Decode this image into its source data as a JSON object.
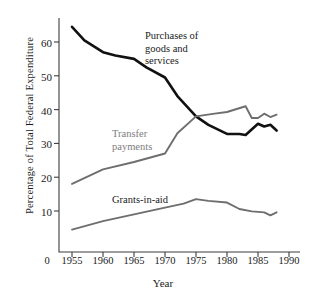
{
  "chart_data": {
    "type": "line",
    "title": "",
    "xlabel": "Year",
    "ylabel": "Percentage of Total Federal Expenditure",
    "xlim": [
      1953,
      1990
    ],
    "ylim": [
      0,
      67
    ],
    "xticks": [
      "0",
      "1955",
      "1960",
      "1965",
      "1970",
      "1975",
      "1980",
      "1985",
      "1990"
    ],
    "xtick_values": [
      1953.2,
      1955,
      1960,
      1965,
      1970,
      1975,
      1980,
      1985,
      1990
    ],
    "yticks": [
      "10",
      "20",
      "30",
      "40",
      "50",
      "60"
    ],
    "ytick_values": [
      10,
      20,
      30,
      40,
      50,
      60
    ],
    "grid": false,
    "legend_position": "inline-annotations",
    "series": [
      {
        "name": "Purchases of goods and services",
        "color": "#111111",
        "x": [
          1955,
          1957,
          1960,
          1962,
          1965,
          1967,
          1970,
          1972,
          1975,
          1977,
          1980,
          1982,
          1983,
          1985,
          1986,
          1987,
          1988
        ],
        "values": [
          64.5,
          60.5,
          57.0,
          56.0,
          55.0,
          52.5,
          49.5,
          44.0,
          38.0,
          35.5,
          32.8,
          32.8,
          32.5,
          35.8,
          35.0,
          35.5,
          33.8
        ]
      },
      {
        "name": "Transfer payments",
        "color": "#6e6e6e",
        "x": [
          1955,
          1960,
          1965,
          1970,
          1972,
          1975,
          1978,
          1980,
          1983,
          1984,
          1985,
          1986,
          1987,
          1988
        ],
        "values": [
          18.0,
          22.3,
          24.5,
          27.0,
          33.0,
          38.0,
          38.8,
          39.3,
          41.0,
          37.5,
          37.5,
          38.8,
          37.8,
          38.5
        ]
      },
      {
        "name": "Grants-in-aid",
        "color": "#6e6e6e",
        "x": [
          1955,
          1960,
          1965,
          1970,
          1973,
          1975,
          1977,
          1980,
          1982,
          1984,
          1986,
          1987,
          1988
        ],
        "values": [
          4.5,
          7.0,
          9.0,
          11.0,
          12.2,
          13.5,
          13.0,
          12.5,
          10.6,
          9.9,
          9.6,
          8.7,
          9.6
        ]
      }
    ],
    "annotations": [
      {
        "text_lines": [
          "Purchases of",
          "goods and",
          "services"
        ],
        "color": "#1a1a1a"
      },
      {
        "text_lines": [
          "Transfer",
          "payments"
        ],
        "color": "#7d7d7d"
      },
      {
        "text_lines": [
          "Grants-in-aid"
        ],
        "color": "#1a1a1a"
      }
    ]
  },
  "annotation_purchases": {
    "l1": "Purchases of",
    "l2": "goods and",
    "l3": "services"
  },
  "annotation_transfer": {
    "l1": "Transfer",
    "l2": "payments"
  },
  "annotation_grants": {
    "l1": "Grants-in-aid"
  },
  "axis": {
    "ylabel": "Percentage of Total Federal Expenditure",
    "xlabel": "Year",
    "ytick_0": "10",
    "ytick_1": "20",
    "ytick_2": "30",
    "ytick_3": "40",
    "ytick_4": "50",
    "ytick_5": "60",
    "xtick_0": "0",
    "xtick_1": "1955",
    "xtick_2": "1960",
    "xtick_3": "1965",
    "xtick_4": "1970",
    "xtick_5": "1975",
    "xtick_6": "1980",
    "xtick_7": "1985",
    "xtick_8": "1990"
  }
}
